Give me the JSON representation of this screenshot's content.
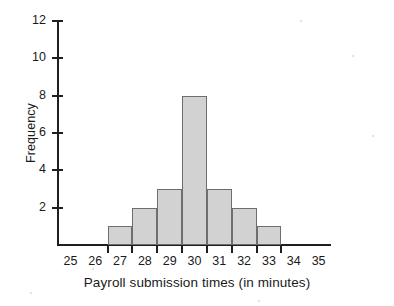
{
  "chart_data": {
    "type": "bar",
    "title": "",
    "xlabel": "Payroll submission times (in minutes)",
    "ylabel": "Frequency",
    "categories": [
      "26.5-27.5",
      "27.5-28.5",
      "28.5-29.5",
      "29.5-30.5",
      "30.5-31.5",
      "31.5-32.5",
      "32.5-33.5"
    ],
    "bin_edges": [
      26.5,
      27.5,
      28.5,
      29.5,
      30.5,
      31.5,
      32.5,
      33.5
    ],
    "values": [
      1,
      2,
      3,
      8,
      3,
      2,
      1
    ],
    "bar_centers": [
      27,
      28,
      29,
      30,
      31,
      32,
      33
    ],
    "xlim": [
      24.5,
      35.5
    ],
    "ylim": [
      0,
      12
    ],
    "x_tick_labels": [
      "25",
      "26",
      "27",
      "28",
      "29",
      "30",
      "31",
      "32",
      "33",
      "34",
      "35"
    ],
    "x_tick_values": [
      25,
      26,
      27,
      28,
      29,
      30,
      31,
      32,
      33,
      34,
      35
    ],
    "y_tick_labels": [
      "2",
      "4",
      "6",
      "8",
      "10",
      "12"
    ],
    "y_tick_values": [
      2,
      4,
      6,
      8,
      10,
      12
    ],
    "grid": false,
    "legend": null,
    "bar_fill_color": "#d2d2d2",
    "bar_edge_color": "#6e6e6e",
    "axis_color": "#1f1f1f"
  }
}
